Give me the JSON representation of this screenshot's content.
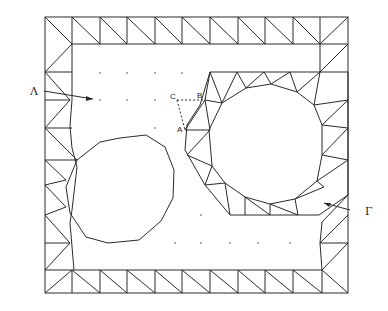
{
  "figure": {
    "labels": {
      "lambda": "Λ",
      "gamma": "Γ",
      "point_a": "A",
      "point_b": "B",
      "point_c": "C"
    },
    "colors": {
      "line": "#2a2a2a",
      "background": "#ffffff"
    }
  }
}
